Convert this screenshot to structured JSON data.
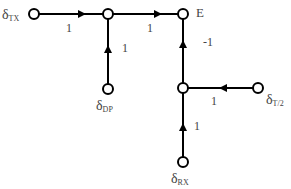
{
  "diagram": {
    "type": "signal-flow-graph",
    "nodes": [
      {
        "id": "tx",
        "label": "δ",
        "sub": "TX"
      },
      {
        "id": "j1",
        "label": ""
      },
      {
        "id": "e",
        "label": "E"
      },
      {
        "id": "dp",
        "label": "δ",
        "sub": "DP"
      },
      {
        "id": "j2",
        "label": ""
      },
      {
        "id": "t2",
        "label": "δ",
        "sub": "T/2"
      },
      {
        "id": "rx",
        "label": "δ",
        "sub": "RX"
      }
    ],
    "edges": [
      {
        "from": "tx",
        "to": "j1",
        "gain": "1"
      },
      {
        "from": "j1",
        "to": "e",
        "gain": "1"
      },
      {
        "from": "dp",
        "to": "j1",
        "gain": "1"
      },
      {
        "from": "j2",
        "to": "e",
        "gain": "-1"
      },
      {
        "from": "t2",
        "to": "j2",
        "gain": "1"
      },
      {
        "from": "rx",
        "to": "j2",
        "gain": "1"
      }
    ],
    "colors": {
      "line": "#000000",
      "text": "#444444",
      "node_fill": "#ffffff"
    }
  }
}
